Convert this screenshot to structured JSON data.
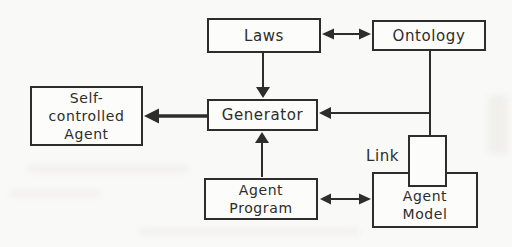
{
  "figure": {
    "type": "block-diagram",
    "background_color": "#f9f9f7",
    "line_color": "#2d2d2b",
    "box_fill": "#fcfcfa",
    "nodes": {
      "laws": {
        "label": "Laws"
      },
      "ontology": {
        "label": "Ontology"
      },
      "generator": {
        "label": "Generator"
      },
      "self_controlled_agent": {
        "line1": "Self-",
        "line2": "controlled",
        "line3": "Agent"
      },
      "agent_program": {
        "line1": "Agent",
        "line2": "Program"
      },
      "agent_model": {
        "line1": "Agent",
        "line2": "Model"
      },
      "link": {
        "label": "Link"
      }
    },
    "edges": [
      {
        "from": "laws",
        "to": "ontology",
        "type": "bidirectional-arrow"
      },
      {
        "from": "laws",
        "to": "generator",
        "type": "arrow"
      },
      {
        "from": "ontology",
        "to": "generator",
        "type": "arrow"
      },
      {
        "from": "generator",
        "to": "self_controlled_agent",
        "type": "bold-arrow"
      },
      {
        "from": "agent_program",
        "to": "generator",
        "type": "arrow"
      },
      {
        "from": "agent_program",
        "to": "agent_model",
        "type": "bidirectional-arrow"
      },
      {
        "from": "ontology",
        "to": "agent_model",
        "type": "plain-line-through-link-box"
      }
    ]
  }
}
